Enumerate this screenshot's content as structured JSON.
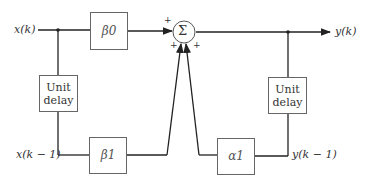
{
  "diagram": {
    "signals": {
      "input": "x(k)",
      "output": "y(k)",
      "input_delayed": "x(k − 1)",
      "output_delayed": "y(k − 1)"
    },
    "blocks": {
      "beta0": "β0",
      "beta1": "β1",
      "alpha1": "α1",
      "delay_left_line1": "Unit",
      "delay_left_line2": "delay",
      "delay_right_line1": "Unit",
      "delay_right_line2": "delay"
    },
    "summer": {
      "symbol": "Σ",
      "signs": [
        "+",
        "+",
        "+"
      ]
    }
  }
}
